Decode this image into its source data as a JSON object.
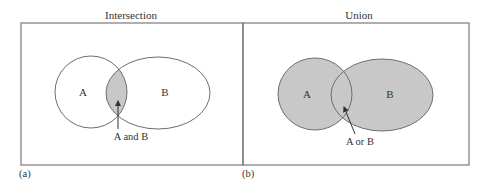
{
  "figure": {
    "colors": {
      "frame": "#7a7a7a",
      "outline": "#6e6e6e",
      "shade": "#c8c8c8",
      "text": "#333333",
      "background": "#ffffff"
    },
    "panels": [
      {
        "id": "a",
        "title": "Intersection",
        "panel_label": "(a)",
        "set_a_label": "A",
        "set_b_label": "B",
        "callout": "A and B",
        "shaded_region": "intersection"
      },
      {
        "id": "b",
        "title": "Union",
        "panel_label": "(b)",
        "set_a_label": "A",
        "set_b_label": "B",
        "callout": "A or B",
        "shaded_region": "union"
      }
    ]
  }
}
